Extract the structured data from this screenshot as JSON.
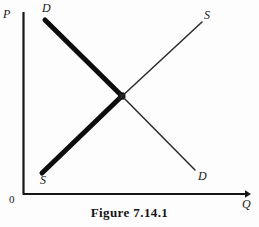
{
  "figure": {
    "caption": "Figure 7.14.1",
    "background_color": "#fdfdfd",
    "ink_color": "#171717"
  },
  "axes": {
    "y_axis_label": "P",
    "x_axis_label": "Q",
    "origin_label": "0"
  },
  "curve_labels": {
    "demand_top": "D",
    "supply_top": "S",
    "supply_bottom": "S",
    "demand_bottom": "D"
  },
  "chart_data": {
    "type": "line",
    "title": "Figure 7.14.1",
    "xlabel": "Q",
    "ylabel": "P",
    "grid": false,
    "legend": "none",
    "axis_ticks": [],
    "annotations": [
      {
        "text": "D",
        "x": 44,
        "y": 5,
        "note": "upper-left endpoint label of thick demand curve"
      },
      {
        "text": "S",
        "x": 206,
        "y": 13,
        "note": "upper-right endpoint label of thin supply curve"
      },
      {
        "text": "S",
        "x": 41,
        "y": 176,
        "note": "lower-left endpoint label of thick supply curve"
      },
      {
        "text": "D",
        "x": 199,
        "y": 172,
        "note": "lower-right endpoint label of thin demand curve"
      },
      {
        "text": "0",
        "x": 10,
        "y": 196,
        "note": "origin"
      },
      {
        "text": "P",
        "x": 4,
        "y": 8,
        "note": "vertical axis label"
      },
      {
        "text": "Q",
        "x": 243,
        "y": 200,
        "note": "horizontal axis label"
      }
    ],
    "series": [
      {
        "name": "Demand (thick, downward sloping)",
        "style": "thick",
        "stroke_width": 5,
        "color": "#0d0d0d",
        "points": [
          [
            45,
            20
          ],
          [
            122,
            96
          ]
        ]
      },
      {
        "name": "Supply (thick, upward sloping)",
        "style": "thick",
        "stroke_width": 5,
        "color": "#0d0d0d",
        "points": [
          [
            42,
            173
          ],
          [
            122,
            96
          ]
        ]
      },
      {
        "name": "Supply (thin, upward sloping)",
        "style": "thin",
        "stroke_width": 1.5,
        "color": "#2a2a2a",
        "points": [
          [
            122,
            96
          ],
          [
            202,
            22
          ]
        ]
      },
      {
        "name": "Demand (thin, downward sloping)",
        "style": "thin",
        "stroke_width": 1.5,
        "color": "#2a2a2a",
        "points": [
          [
            122,
            96
          ],
          [
            195,
            170
          ]
        ]
      }
    ],
    "intersection": {
      "x": 122,
      "y": 96
    },
    "axis_geometry": {
      "y_axis": [
        [
          23,
          12
        ],
        [
          23,
          194
        ]
      ],
      "x_axis": [
        [
          23,
          194
        ],
        [
          248,
          194
        ]
      ],
      "x_axis_arrow": true,
      "y_axis_arrow": false
    }
  }
}
